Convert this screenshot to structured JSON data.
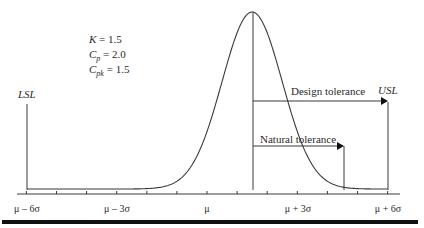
{
  "parameters": {
    "k": {
      "symbol": "K",
      "value": "1.5"
    },
    "cp": {
      "symbol": "C",
      "sub": "p",
      "value": "2.0"
    },
    "cpk": {
      "symbol": "C",
      "sub": "pk",
      "value": "1.5"
    }
  },
  "limits": {
    "lsl": "LSL",
    "usl": "USL"
  },
  "arrows": {
    "design_tolerance": "Design tolerance",
    "natural_tolerance": "Natural tolerance"
  },
  "axis": {
    "tick_labels": [
      {
        "label": "μ – 6σ",
        "position": -6
      },
      {
        "label": "μ – 3σ",
        "position": -3
      },
      {
        "label": "μ",
        "position": 0
      },
      {
        "label": "μ + 3σ",
        "position": 3
      },
      {
        "label": "μ + 6σ",
        "position": 6
      }
    ],
    "tick_range": [
      -6,
      6
    ],
    "tick_step": 1
  },
  "distribution": {
    "type": "normal",
    "mean_shift_sigma": 1.5
  },
  "colors": {
    "line": "#3a3a3a",
    "text": "#2a2a2a",
    "rule": "#111111"
  }
}
